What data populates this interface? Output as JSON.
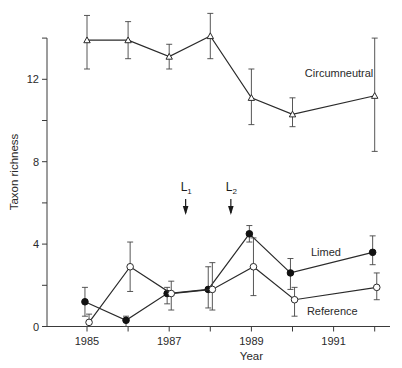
{
  "chart_data": {
    "type": "line",
    "title": "",
    "xlabel": "Year",
    "ylabel": "Taxon richness",
    "xlim": [
      1984.3,
      1992.4
    ],
    "ylim": [
      0,
      14
    ],
    "x_ticks": [
      1985,
      1986,
      1987,
      1988,
      1989,
      1990,
      1991,
      1992
    ],
    "x_tick_labels": {
      "1985": "1985",
      "1987": "1987",
      "1989": "1989",
      "1991": "1991"
    },
    "y_ticks": [
      0,
      2,
      4,
      6,
      8,
      10,
      12,
      14
    ],
    "y_tick_labels": {
      "0": "0",
      "4": "4",
      "8": "8",
      "12": "12"
    },
    "grid": false,
    "legend": "inline labels",
    "annotations": [
      {
        "label": "L",
        "subscript": "1",
        "x": 1987.4,
        "type": "down-arrow"
      },
      {
        "label": "L",
        "subscript": "2",
        "x": 1988.5,
        "type": "down-arrow"
      }
    ],
    "series": [
      {
        "name": "Circumneutral",
        "marker": "open-triangle",
        "label_pos": {
          "x": 1990.3,
          "y": 12.3
        },
        "x": [
          1985.0,
          1986.0,
          1987.0,
          1988.0,
          1989.0,
          1990.0,
          1992.0
        ],
        "values": [
          13.9,
          13.9,
          13.1,
          14.1,
          11.1,
          10.3,
          11.2
        ],
        "err_high": [
          15.1,
          14.8,
          13.7,
          15.2,
          12.5,
          11.1,
          14.0
        ],
        "err_low": [
          12.5,
          13.0,
          12.5,
          13.0,
          9.8,
          9.7,
          8.5
        ]
      },
      {
        "name": "Limed",
        "marker": "filled-circle",
        "label_pos": {
          "x": 1990.45,
          "y": 3.6
        },
        "x": [
          1984.95,
          1985.95,
          1986.95,
          1987.95,
          1988.95,
          1989.95,
          1991.95
        ],
        "values": [
          1.2,
          0.3,
          1.6,
          1.8,
          4.5,
          2.6,
          3.6
        ],
        "err_high": [
          1.9,
          0.5,
          1.9,
          2.9,
          4.9,
          3.3,
          4.4
        ],
        "err_low": [
          0.5,
          0.0,
          1.1,
          0.9,
          4.1,
          1.8,
          3.0
        ]
      },
      {
        "name": "Reference",
        "marker": "open-circle",
        "label_pos": {
          "x": 1990.35,
          "y": 0.75
        },
        "x": [
          1985.05,
          1986.05,
          1987.05,
          1988.05,
          1989.05,
          1990.05,
          1992.05
        ],
        "values": [
          0.2,
          2.9,
          1.6,
          1.8,
          2.9,
          1.3,
          1.9
        ],
        "err_high": [
          0.6,
          4.1,
          2.2,
          3.1,
          4.3,
          1.9,
          2.6
        ],
        "err_low": [
          0.0,
          1.7,
          0.8,
          0.8,
          1.5,
          0.5,
          1.3
        ]
      }
    ]
  }
}
